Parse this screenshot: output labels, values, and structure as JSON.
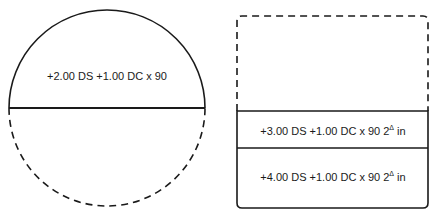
{
  "left_lens": {
    "shape": "circle",
    "upper_label": "+2.00 DS +1.00 DC x 90",
    "lower_half": "dashed"
  },
  "right_lens": {
    "shape": "rounded-rectangle",
    "upper_section": "dashed",
    "segments": [
      {
        "label_main": "+3.00 DS +1.00 DC x 90 2",
        "prism_symbol": "Δ",
        "label_suffix": " in"
      },
      {
        "label_main": "+4.00 DS +1.00 DC x 90 2",
        "prism_symbol": "Δ",
        "label_suffix": " in"
      }
    ]
  },
  "colors": {
    "stroke": "#1a1a1a",
    "background": "#ffffff"
  }
}
